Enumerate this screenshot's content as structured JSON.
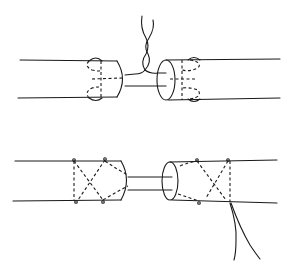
{
  "diagram": {
    "title": "",
    "panels": [
      {
        "id": "top",
        "description": "Two tubes with ends bound by looped stitches, joined by two strands twisted together above"
      },
      {
        "id": "bottom",
        "description": "Two tubes with ends bound by criss-cross stitches, joined by two parallel strands; loose thread ends hang below right tube"
      }
    ],
    "colors": {
      "line": "#1a1a1a",
      "background": "#ffffff"
    }
  }
}
